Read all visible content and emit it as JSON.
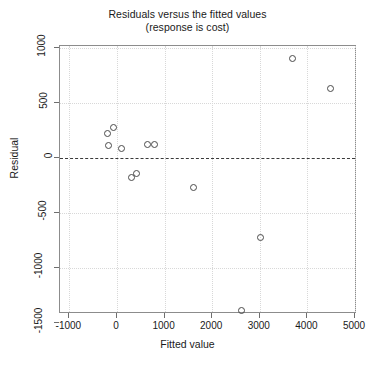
{
  "chart_data": {
    "type": "scatter",
    "title": "Residuals versus the fitted values",
    "subtitle": "(response is cost)",
    "xlabel": "Fitted value",
    "ylabel": "Residual",
    "xlim": [
      -1300,
      5000
    ],
    "ylim": [
      -1500,
      1200
    ],
    "grid": true,
    "legend": "none",
    "xticks": [
      -1000,
      0,
      1000,
      2000,
      3000,
      4000,
      5000
    ],
    "xtick_labels": [
      "-1000",
      "0",
      "1000",
      "2000",
      "3000",
      "4000",
      "5000"
    ],
    "yticks": [
      1000,
      500,
      0,
      -500,
      -1000,
      -1500
    ],
    "ytick_labels": [
      "1000",
      "500",
      "0",
      "-500",
      "-1000",
      "-1500"
    ],
    "reference_line": {
      "y": 0,
      "style": "dashed"
    },
    "points": [
      {
        "x": -90,
        "y": 285
      },
      {
        "x": -215,
        "y": 225
      },
      {
        "x": -195,
        "y": 120
      },
      {
        "x": 75,
        "y": 90
      },
      {
        "x": 640,
        "y": 130
      },
      {
        "x": 780,
        "y": 130
      },
      {
        "x": 290,
        "y": -170
      },
      {
        "x": 390,
        "y": -140
      },
      {
        "x": 1605,
        "y": -265
      },
      {
        "x": 2610,
        "y": -1385
      },
      {
        "x": 3010,
        "y": -715
      },
      {
        "x": 3680,
        "y": 905
      },
      {
        "x": 4480,
        "y": 640
      }
    ]
  }
}
